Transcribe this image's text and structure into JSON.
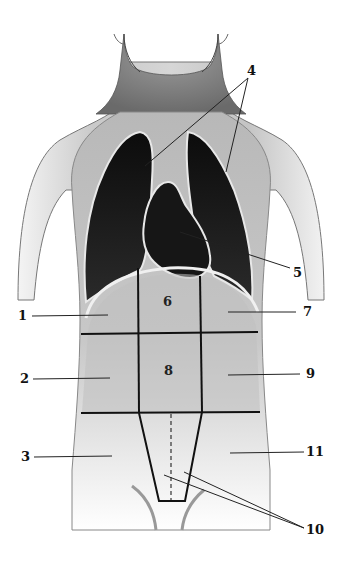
{
  "figure": {
    "colors": {
      "skin_light": "#e8e8e8",
      "skin_mid": "#bdbdbd",
      "skin_dark": "#8a8a8a",
      "cavity": "#151515",
      "grid_line": "#111111",
      "leader_line": "#222222",
      "background": "#ffffff"
    }
  },
  "callouts": [
    {
      "id": "1",
      "text": "1",
      "target": "left upper abdominal region"
    },
    {
      "id": "2",
      "text": "2",
      "target": "left middle abdominal region"
    },
    {
      "id": "3",
      "text": "3",
      "target": "left lower abdominal region"
    },
    {
      "id": "4",
      "text": "4",
      "target": "lungs (two leader lines)"
    },
    {
      "id": "5",
      "text": "5",
      "target": "heart"
    },
    {
      "id": "7",
      "text": "7",
      "target": "right upper abdominal region"
    },
    {
      "id": "9",
      "text": "9",
      "target": "right middle abdominal region"
    },
    {
      "id": "10",
      "text": "10",
      "target": "lower central region (two leader lines)"
    },
    {
      "id": "11",
      "text": "11",
      "target": "right lower abdominal region"
    }
  ],
  "region_labels": [
    {
      "id": "6",
      "text": "6"
    },
    {
      "id": "8",
      "text": "8"
    }
  ]
}
